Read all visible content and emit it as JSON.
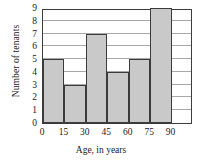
{
  "chart_data": {
    "type": "bar",
    "subtype": "histogram",
    "title": "",
    "xlabel": "Age, in years",
    "ylabel": "Number of tenants",
    "categories": [
      "0-15",
      "15-30",
      "30-45",
      "45-60",
      "60-75",
      "75-90"
    ],
    "bin_edges": [
      0,
      15,
      30,
      45,
      60,
      75,
      90
    ],
    "values": [
      5,
      3,
      7,
      4,
      5,
      9
    ],
    "xlim": [
      0,
      105
    ],
    "ylim": [
      0,
      9
    ],
    "xticks": [
      "0",
      "15",
      "30",
      "45",
      "60",
      "75",
      "90"
    ],
    "yticks": [
      "0",
      "1",
      "2",
      "3",
      "4",
      "5",
      "6",
      "7",
      "8",
      "9"
    ],
    "grid": "horizontal",
    "legend": "none",
    "bar_fill_color": "#c9c9c9",
    "bar_edge_color": "#3b3b3b",
    "axis_color": "#3d3d3d",
    "gridline_color": "#a8a8a8",
    "background_color": "#ffffff"
  }
}
